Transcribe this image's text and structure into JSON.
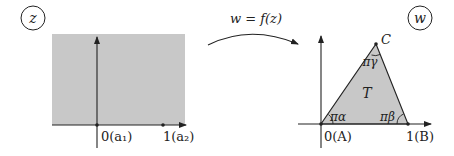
{
  "left_plane": {
    "badge": "z",
    "region": "upper half-plane (shaded)",
    "labels": {
      "origin": "0(a₁)",
      "one": "1(a₂)"
    }
  },
  "mapping": {
    "label": "w = f(z)"
  },
  "right_plane": {
    "badge": "w",
    "triangle_label": "T",
    "vertices": {
      "A": "0(A)",
      "B": "1(B)",
      "C": "C"
    },
    "angles": {
      "alpha": "πα",
      "beta": "πβ",
      "gamma": "πγ"
    }
  },
  "colors": {
    "shade": "#c8c8c8",
    "ink": "#222222",
    "background": "#ffffff"
  }
}
